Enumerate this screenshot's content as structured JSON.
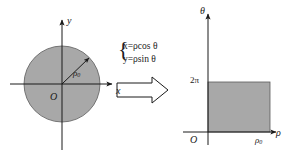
{
  "figure": {
    "type": "math-diagram",
    "background_color": "#ffffff",
    "stroke_color": "#1a1a1a",
    "fill_color": "#a8a8a8"
  },
  "left_diagram": {
    "name": "xy-plane-disk",
    "axis_x_label": "x",
    "axis_y_label": "y",
    "origin_label": "O",
    "radius_label": "ρ",
    "radius_subscript": "0",
    "circle": {
      "cx": 62,
      "cy": 84,
      "r": 38,
      "fill": "#a8a8a8"
    }
  },
  "transform": {
    "name": "coordinate-transform-equations",
    "arrow_label": "maps to",
    "equations": [
      {
        "lhs": "x",
        "eq": "=",
        "rhs_rho": "ρ",
        "rhs_fn": "cos ",
        "rhs_theta": "θ"
      },
      {
        "lhs": "y",
        "eq": "=",
        "rhs_rho": "ρ",
        "rhs_fn": "sin ",
        "rhs_theta": "θ"
      }
    ],
    "equation_1_text": "x=ρcos θ",
    "equation_2_text": "y=ρsin θ"
  },
  "right_diagram": {
    "name": "rho-theta-plane-rectangle",
    "axis_rho_label": "ρ",
    "axis_theta_label": "θ",
    "origin_label": "O",
    "theta_tick_label": "2π",
    "rho_tick_label": "ρ",
    "rho_tick_subscript": "0",
    "rectangle": {
      "x": 208,
      "y": 82,
      "w": 62,
      "h": 50,
      "fill": "#a8a8a8"
    }
  }
}
